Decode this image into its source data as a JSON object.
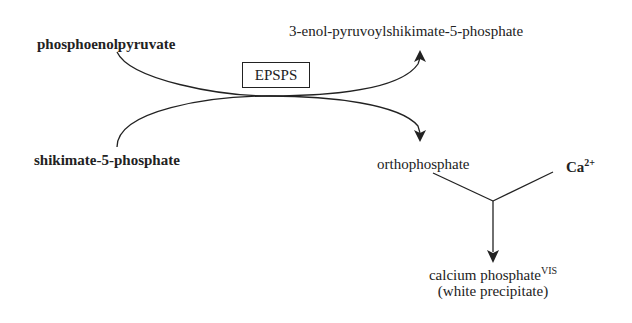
{
  "diagram": {
    "type": "reaction-pathway",
    "substrates": {
      "top": "phosphoenolpyruvate",
      "bottom": "shikimate-5-phosphate"
    },
    "enzyme": "EPSPS",
    "products": {
      "top": "3-enol-pyruvoylshikimate-5-phosphate",
      "bottom": "orthophosphate"
    },
    "reagent": {
      "label": "Ca",
      "charge": "2+"
    },
    "final_product": {
      "label": "calcium phosphate",
      "superscript": "VIS",
      "note": "(white precipitate)"
    },
    "colors": {
      "line": "#222222",
      "background": "#ffffff"
    }
  }
}
